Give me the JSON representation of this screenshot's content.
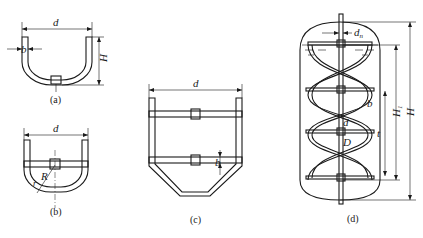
{
  "figure": {
    "panels": [
      {
        "id": "a",
        "caption": "(a)",
        "type": "anchor",
        "labels": {
          "diameter": "d",
          "width": "b",
          "height": "H"
        }
      },
      {
        "id": "b",
        "caption": "(b)",
        "type": "anchor-with-crossbar",
        "labels": {
          "diameter": "d",
          "radius": "R",
          "fillet": "r"
        }
      },
      {
        "id": "c",
        "caption": "(c)",
        "type": "frame",
        "labels": {
          "diameter": "d",
          "width": "b"
        }
      },
      {
        "id": "d",
        "caption": "(d)",
        "type": "helical-ribbon",
        "labels": {
          "shaft_diameter": "d",
          "shaft_sub": "n",
          "width": "b",
          "inner_diameter": "d",
          "outer_diameter": "D",
          "pitch": "t",
          "liquid_height": "H",
          "liquid_height_sub": "1",
          "vessel_height": "H"
        }
      }
    ]
  },
  "colors": {
    "line": "#1a1a1a",
    "background": "#ffffff"
  }
}
